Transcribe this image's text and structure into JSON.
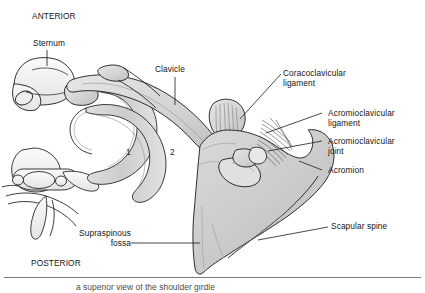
{
  "figure": {
    "orientation": {
      "anterior": "ANTERIOR",
      "posterior": "POSTERIOR"
    },
    "labels": [
      {
        "id": "sternum",
        "text": "Sternum"
      },
      {
        "id": "clavicle",
        "text": "Clavicle"
      },
      {
        "id": "coracoclavicular-ligament",
        "line1": "Coracoclavicular",
        "line2": "ligament"
      },
      {
        "id": "acromioclavicular-ligament",
        "line1": "Acromioclavicular",
        "line2": "ligament"
      },
      {
        "id": "acromioclavicular-joint",
        "line1": "Acromioclavicular",
        "line2": "joint"
      },
      {
        "id": "acromion",
        "text": "Acromion"
      },
      {
        "id": "scapular-spine",
        "text": "Scapular spine"
      },
      {
        "id": "supraspinous-fossa",
        "line1": "Supraspinous",
        "line2": "fossa"
      }
    ],
    "rib_numbers": [
      "1",
      "2"
    ],
    "caption": "a superior view of the shoulder girdle",
    "colors": {
      "outline": "#1a1a1a",
      "bone_light": "#f2f2f2",
      "bone_mid": "#d9d9d9",
      "bone_shade": "#c4c4c4",
      "scapula_fill": "#cfcfcf",
      "background": "#ffffff",
      "rule": "#7a7a7a"
    }
  }
}
